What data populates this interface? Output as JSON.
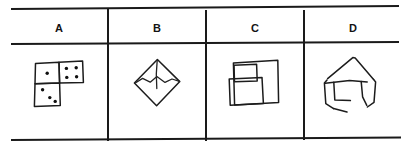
{
  "table": {
    "columns": [
      {
        "id": "col-a",
        "label": "A"
      },
      {
        "id": "col-b",
        "label": "B"
      },
      {
        "id": "col-c",
        "label": "C"
      },
      {
        "id": "col-d",
        "label": "D"
      }
    ],
    "rules": {
      "top_rule": "horizontal-rule-top",
      "header_rule": "horizontal-rule-under-header",
      "bottom_rule": "horizontal-rule-bottom",
      "dividers": 3
    },
    "line_color": "#1a1a1a",
    "background_color": "#ffffff"
  },
  "figures": {
    "a": {
      "name": "three-squares-with-dots",
      "description": "L-shaped arrangement of three hand-drawn squares with dice-style dots",
      "square_count": 3,
      "dot_counts": [
        1,
        4,
        3
      ],
      "total_dots": 8
    },
    "b": {
      "name": "diamond-with-folded-flap",
      "description": "Hand-drawn diamond (rotated square) with a vertical line from the top vertex and a folded chevron flap",
      "square_count": 1,
      "internal_lines": 2
    },
    "c": {
      "name": "overlapping-squares",
      "description": "Large hand-drawn square overlapped by a small square at upper left and a medium square below it",
      "square_count": 3,
      "internal_lines": 0
    },
    "d": {
      "name": "house-shape-with-box",
      "description": "Hand-drawn house outline: peaked roof above an open box with an inner square",
      "square_count": 2,
      "internal_lines": 3
    }
  },
  "colors": {
    "ink": "#1c1c1c",
    "rule": "#1a1a1a",
    "paper": "#ffffff",
    "text": "#131313"
  }
}
